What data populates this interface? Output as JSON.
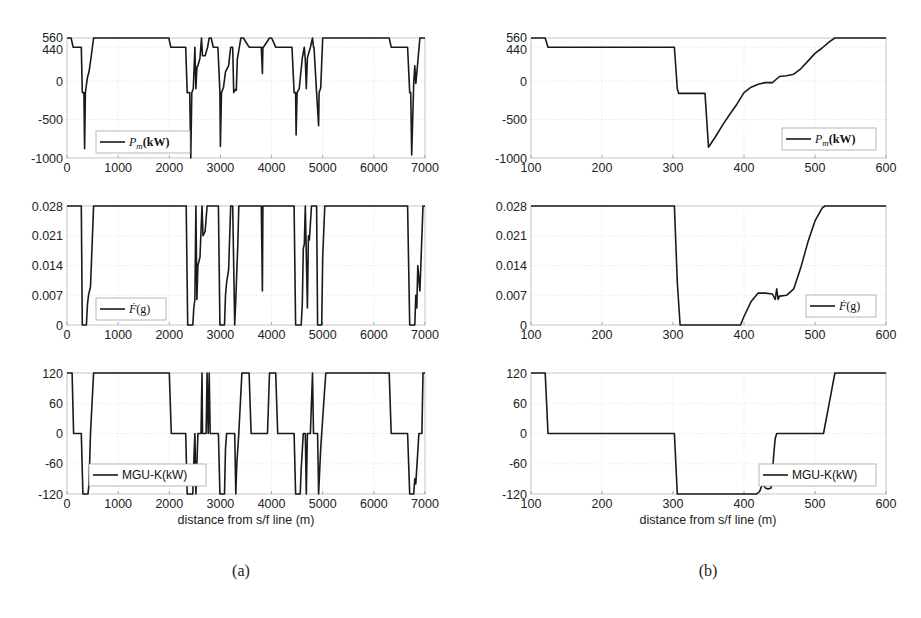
{
  "figure": {
    "subfigure_labels": [
      "(a)",
      "(b)"
    ],
    "xlabel": "distance from s/f line (m)",
    "colors": {
      "line": "#1a1a1a",
      "grid": "#dcdcdc",
      "axis": "#bdbdbd",
      "text": "#222222"
    }
  },
  "chart_data": [
    {
      "id": "a1",
      "panel": "a",
      "type": "line",
      "legend": "P_m(kW)",
      "legend_display": "Pm(kW)",
      "legend_position": "lower-left",
      "xlim": [
        0,
        7000
      ],
      "ylim": [
        -1000,
        560
      ],
      "xticks": [
        0,
        1000,
        2000,
        3000,
        4000,
        5000,
        6000,
        7000
      ],
      "yticks": [
        -1000,
        -500,
        0,
        440,
        560
      ],
      "grid": true,
      "x": [
        0,
        80,
        120,
        280,
        300,
        330,
        345,
        360,
        380,
        400,
        430,
        470,
        520,
        1990,
        2030,
        2320,
        2350,
        2400,
        2420,
        2440,
        2470,
        2500,
        2520,
        2540,
        2560,
        2600,
        2630,
        2650,
        2700,
        2750,
        2780,
        2820,
        2860,
        2950,
        2990,
        3000,
        3020,
        3060,
        3100,
        3160,
        3200,
        3240,
        3260,
        3290,
        3310,
        3330,
        3360,
        3400,
        3450,
        3560,
        3600,
        3800,
        3820,
        3830,
        3840,
        3960,
        4000,
        4080,
        4120,
        4400,
        4440,
        4470,
        4480,
        4500,
        4540,
        4600,
        4640,
        4660,
        4680,
        4700,
        4720,
        4760,
        4800,
        4820,
        4830,
        4880,
        4920,
        4930,
        4960,
        5000,
        5060,
        6300,
        6340,
        6660,
        6700,
        6720,
        6740,
        6780,
        6800,
        6820,
        6840,
        6860,
        6900,
        6950,
        7000
      ],
      "values": [
        560,
        560,
        440,
        440,
        -150,
        -150,
        -880,
        -150,
        -50,
        50,
        120,
        300,
        560,
        560,
        440,
        440,
        -150,
        -150,
        -1000,
        -150,
        -100,
        440,
        -100,
        180,
        200,
        300,
        560,
        330,
        330,
        440,
        560,
        560,
        440,
        440,
        -150,
        -850,
        -150,
        -80,
        120,
        200,
        440,
        440,
        -150,
        -110,
        -120,
        280,
        400,
        560,
        560,
        440,
        440,
        440,
        100,
        440,
        440,
        560,
        560,
        440,
        440,
        440,
        -150,
        -150,
        -700,
        -150,
        -100,
        300,
        440,
        280,
        -100,
        300,
        350,
        440,
        560,
        440,
        440,
        -150,
        -580,
        -150,
        -90,
        560,
        560,
        560,
        440,
        440,
        -150,
        -150,
        -960,
        -30,
        200,
        -30,
        100,
        250,
        560,
        560,
        560
      ]
    },
    {
      "id": "b1",
      "panel": "b",
      "type": "line",
      "legend": "P_m(kW)",
      "legend_display": "Pm(kW)",
      "legend_position": "lower-right",
      "xlim": [
        100,
        600
      ],
      "ylim": [
        -1000,
        560
      ],
      "xticks": [
        100,
        200,
        300,
        400,
        500,
        600
      ],
      "yticks": [
        -1000,
        -500,
        0,
        440,
        560
      ],
      "grid": true,
      "x": [
        100,
        120,
        124,
        302,
        306,
        308,
        345,
        350,
        360,
        370,
        380,
        390,
        400,
        410,
        420,
        430,
        440,
        445,
        450,
        460,
        470,
        480,
        490,
        500,
        510,
        520,
        528,
        600
      ],
      "values": [
        560,
        560,
        440,
        440,
        -100,
        -160,
        -160,
        -860,
        -720,
        -570,
        -430,
        -300,
        -150,
        -80,
        -40,
        -20,
        -20,
        20,
        60,
        70,
        90,
        160,
        260,
        360,
        430,
        510,
        560,
        560
      ]
    },
    {
      "id": "a2",
      "panel": "a",
      "type": "line",
      "legend": "F_dot(g)",
      "legend_display": "Ḟ(g)",
      "legend_position": "lower-left",
      "xlim": [
        0,
        7000
      ],
      "ylim": [
        0,
        0.028
      ],
      "xticks": [
        0,
        1000,
        2000,
        3000,
        4000,
        5000,
        6000,
        7000
      ],
      "yticks": [
        0,
        0.007,
        0.014,
        0.021,
        0.028
      ],
      "grid": true,
      "x": [
        0,
        280,
        300,
        380,
        400,
        420,
        440,
        460,
        520,
        2330,
        2360,
        2460,
        2480,
        2500,
        2520,
        2540,
        2560,
        2600,
        2640,
        2660,
        2700,
        2740,
        2960,
        2990,
        3080,
        3100,
        3120,
        3160,
        3200,
        3240,
        3280,
        3300,
        3340,
        3360,
        3380,
        3800,
        3820,
        3830,
        3840,
        4440,
        4470,
        4580,
        4600,
        4620,
        4640,
        4660,
        4700,
        4720,
        4740,
        4780,
        4820,
        4880,
        4900,
        4980,
        5000,
        5040,
        6660,
        6700,
        6800,
        6820,
        6840,
        6860,
        6900,
        6960,
        7000
      ],
      "values": [
        0.028,
        0.028,
        0,
        0,
        0.005,
        0.007,
        0.008,
        0.009,
        0.028,
        0.028,
        0,
        0,
        0.004,
        0.006,
        0.028,
        0.006,
        0.014,
        0.016,
        0.028,
        0.021,
        0.022,
        0.028,
        0.028,
        0,
        0,
        0.007,
        0.01,
        0.013,
        0.028,
        0.028,
        0,
        0.006,
        0.019,
        0.028,
        0.028,
        0.028,
        0.008,
        0.028,
        0.028,
        0.028,
        0,
        0,
        0.005,
        0.018,
        0.019,
        0.028,
        0.004,
        0.021,
        0.02,
        0.028,
        0.028,
        0.028,
        0,
        0,
        0.016,
        0.028,
        0.028,
        0,
        0,
        0.007,
        0.004,
        0.014,
        0.008,
        0.028,
        0.028
      ]
    },
    {
      "id": "b2",
      "panel": "b",
      "type": "line",
      "legend": "F_dot(g)",
      "legend_display": "Ḟ(g)",
      "legend_position": "lower-right",
      "xlim": [
        100,
        600
      ],
      "ylim": [
        0,
        0.028
      ],
      "xticks": [
        100,
        200,
        300,
        400,
        500,
        600
      ],
      "yticks": [
        0,
        0.007,
        0.014,
        0.021,
        0.028
      ],
      "grid": true,
      "x": [
        100,
        302,
        306,
        310,
        395,
        400,
        410,
        420,
        430,
        440,
        444,
        446,
        448,
        450,
        460,
        470,
        480,
        490,
        500,
        510,
        514,
        600
      ],
      "values": [
        0.028,
        0.028,
        0.01,
        0,
        0,
        0.002,
        0.0055,
        0.0075,
        0.0075,
        0.0073,
        0.006,
        0.0085,
        0.006,
        0.0068,
        0.007,
        0.0085,
        0.0135,
        0.0195,
        0.0245,
        0.0275,
        0.028,
        0.028
      ]
    },
    {
      "id": "a3",
      "panel": "a",
      "type": "line",
      "legend": "MGU-K(kW)",
      "legend_display": "MGU-K(kW)",
      "legend_position": "lower-left",
      "xlim": [
        0,
        7000
      ],
      "ylim": [
        -120,
        120
      ],
      "xticks": [
        0,
        1000,
        2000,
        3000,
        4000,
        5000,
        6000,
        7000
      ],
      "yticks": [
        -120,
        -60,
        0,
        60,
        120
      ],
      "grid": true,
      "x": [
        0,
        100,
        130,
        280,
        310,
        410,
        430,
        460,
        520,
        2000,
        2040,
        2320,
        2350,
        2460,
        2480,
        2500,
        2520,
        2560,
        2570,
        2620,
        2640,
        2650,
        2680,
        2720,
        2740,
        2760,
        2780,
        2800,
        2960,
        2990,
        3080,
        3100,
        3120,
        3160,
        3280,
        3300,
        3320,
        3360,
        3420,
        3560,
        3600,
        3920,
        3960,
        4080,
        4120,
        4440,
        4470,
        4560,
        4580,
        4620,
        4660,
        4680,
        4700,
        4720,
        4760,
        4800,
        4820,
        4830,
        4900,
        4920,
        4960,
        4980,
        5060,
        6300,
        6340,
        6660,
        6700,
        6780,
        6800,
        6820,
        6880,
        6940,
        6960,
        7000
      ],
      "values": [
        120,
        120,
        0,
        0,
        -120,
        -120,
        -100,
        0,
        120,
        120,
        0,
        0,
        -120,
        -120,
        -55,
        0,
        -120,
        0,
        0,
        0,
        120,
        0,
        0,
        0,
        120,
        0,
        120,
        0,
        0,
        -120,
        -120,
        -30,
        0,
        0,
        0,
        -120,
        -60,
        0,
        120,
        120,
        0,
        0,
        120,
        120,
        0,
        0,
        -120,
        -120,
        -70,
        0,
        0,
        -120,
        0,
        0,
        0,
        120,
        0,
        0,
        0,
        -120,
        -30,
        0,
        120,
        120,
        0,
        0,
        -120,
        -120,
        -90,
        -100,
        0,
        0,
        120,
        120
      ]
    },
    {
      "id": "b3",
      "panel": "b",
      "type": "line",
      "legend": "MGU-K(kW)",
      "legend_display": "MGU-K(kW)",
      "legend_position": "lower-right",
      "xlim": [
        100,
        600
      ],
      "ylim": [
        -120,
        120
      ],
      "xticks": [
        100,
        200,
        300,
        400,
        500,
        600
      ],
      "yticks": [
        -120,
        -60,
        0,
        60,
        120
      ],
      "grid": true,
      "x": [
        100,
        120,
        124,
        302,
        306,
        418,
        422,
        426,
        430,
        434,
        438,
        440,
        442,
        444,
        446,
        512,
        520,
        528,
        600
      ],
      "values": [
        120,
        120,
        0,
        0,
        -120,
        -120,
        -115,
        -100,
        -108,
        -110,
        -108,
        -80,
        -40,
        -10,
        0,
        0,
        60,
        120,
        120
      ]
    }
  ]
}
